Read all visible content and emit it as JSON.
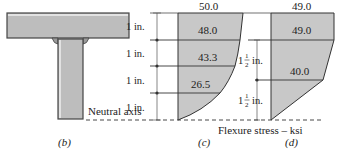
{
  "figure": {
    "panels": [
      {
        "id": "b",
        "caption": "(b)",
        "description": "T-section cross section (flange and web)"
      },
      {
        "id": "c",
        "caption": "(c)",
        "description": "Flexure stress distribution, 1 in. layers"
      },
      {
        "id": "d",
        "caption": "(d)",
        "description": "Flexure stress distribution, 1 1/2 in. layers"
      }
    ],
    "neutral_axis_label": "Neutral axis",
    "x_axis_label": "Flexure stress – ksi",
    "panel_c": {
      "top_value": "50.0",
      "layer_values": [
        "48.0",
        "43.3",
        "26.5"
      ],
      "dimensions": [
        "1 in.",
        "1 in.",
        "1 in.",
        "1 in."
      ]
    },
    "panel_d": {
      "top_value": "49.0",
      "layer_values": [
        "49.0",
        "40.0"
      ],
      "dimensions_whole": [
        "1",
        "1"
      ],
      "dimensions_num": [
        "1",
        "1"
      ],
      "dimensions_den": [
        "2",
        "2"
      ],
      "dimensions_unit": [
        "in.",
        "in."
      ]
    },
    "colors": {
      "fill": "#c8c8c8",
      "stroke": "#333333",
      "beam_fill": "#bdbdbd"
    }
  }
}
